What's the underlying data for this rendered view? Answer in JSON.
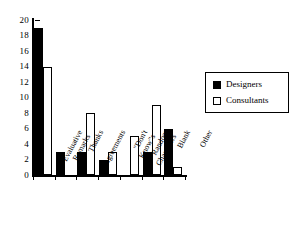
{
  "chart_data": {
    "type": "bar",
    "title": "",
    "subtitle": "",
    "xlabel": "",
    "ylabel": "",
    "ylim": [
      0,
      20
    ],
    "ytick_step": 2,
    "yticks": [
      20,
      18,
      16,
      14,
      12,
      10,
      8,
      6,
      4,
      2,
      0
    ],
    "grid": false,
    "legend_position": "right",
    "categories": [
      "Evaluative Remarks",
      "Thanks",
      "Agreements",
      "\"Don't Know\"s",
      "Random Characters",
      "Blank",
      "Other"
    ],
    "category_lines": [
      [
        "Evaluative",
        "Remarks"
      ],
      [
        "Thanks",
        ""
      ],
      [
        "Agreements",
        ""
      ],
      [
        "\"Don't",
        "Know\"s"
      ],
      [
        "Random",
        "Characters"
      ],
      [
        "Blank",
        ""
      ],
      [
        "Other",
        ""
      ]
    ],
    "series": [
      {
        "name": "Designers",
        "fill": "#000000",
        "values": [
          19,
          3,
          3,
          2,
          0,
          3,
          6
        ]
      },
      {
        "name": "Consultants",
        "fill": "#ffffff",
        "values": [
          14,
          0,
          8,
          3,
          5,
          9,
          1
        ]
      }
    ]
  },
  "legend": {
    "items": [
      {
        "label": "Designers",
        "swatch": "filled-square-icon"
      },
      {
        "label": "Consultants",
        "swatch": "open-square-icon"
      }
    ]
  },
  "colors": {
    "axis": "#000000",
    "designers": "#000000",
    "consultants": "#ffffff",
    "background": "#ffffff"
  }
}
